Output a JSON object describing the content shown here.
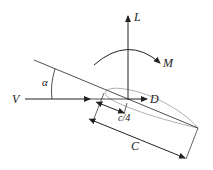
{
  "diagram": {
    "labels": {
      "lift": "L",
      "moment": "M",
      "velocity": "V",
      "drag": "D",
      "angle_of_attack": "α",
      "quarter_chord": "c/4",
      "chord": "C"
    },
    "colors": {
      "line": "#222222",
      "airfoil": "#b0b0b0"
    }
  }
}
